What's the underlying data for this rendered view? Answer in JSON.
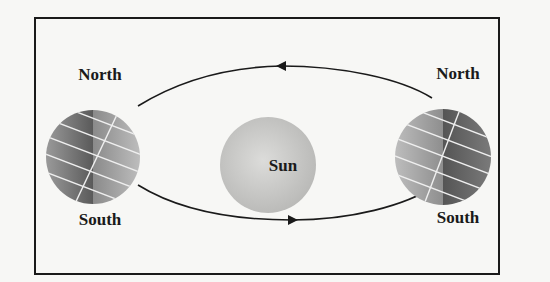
{
  "diagram": {
    "sun": {
      "label": "Sun"
    },
    "earth_left": {
      "north_label": "North",
      "south_label": "South"
    },
    "earth_right": {
      "north_label": "North",
      "south_label": "South"
    },
    "orbit": {
      "direction": "counterclockwise"
    },
    "colors": {
      "frame": "#1a1a1a",
      "background": "#f7f7f5",
      "sun_fill": "#c9c9c7",
      "earth_dark": "#6a6a6a",
      "earth_light": "#a8a8a8",
      "grid_lines": "#f0f0f0"
    }
  }
}
